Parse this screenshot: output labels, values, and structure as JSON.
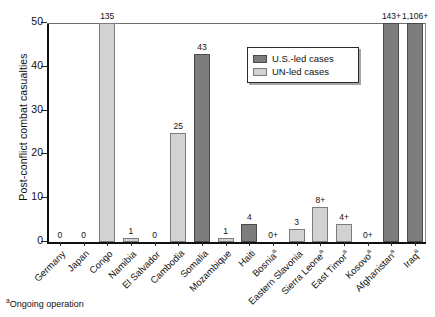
{
  "chart_data": {
    "type": "bar",
    "title": "",
    "xlabel": "",
    "ylabel": "Post-conflict combat casualties",
    "ylim": [
      0,
      50
    ],
    "yticks": [
      0,
      10,
      20,
      30,
      40,
      50
    ],
    "grid": false,
    "legend_position": "top-right",
    "legend": [
      {
        "key": "us",
        "label": "U.S.-led cases",
        "color": "#7d7d7d"
      },
      {
        "key": "un",
        "label": "UN-led cases",
        "color": "#d2d2d2"
      }
    ],
    "categories": [
      "Germany",
      "Japan",
      "Congo",
      "Namibia",
      "El Salvador",
      "Cambodia",
      "Somalia",
      "Mozambique",
      "Haiti",
      "Bosnia",
      "Eastern Slavonia",
      "Sierra Leone",
      "East Timor",
      "Kosovo",
      "Afghanistan",
      "Iraq"
    ],
    "points": [
      {
        "category": "Germany",
        "label": "0",
        "value": 0,
        "plotted": 0,
        "series": "us",
        "ongoing": false
      },
      {
        "category": "Japan",
        "label": "0",
        "value": 0,
        "plotted": 0,
        "series": "us",
        "ongoing": false
      },
      {
        "category": "Congo",
        "label": "135",
        "value": 135,
        "plotted": 50,
        "series": "un",
        "ongoing": false
      },
      {
        "category": "Namibia",
        "label": "1",
        "value": 1,
        "plotted": 1,
        "series": "un",
        "ongoing": false
      },
      {
        "category": "El Salvador",
        "label": "0",
        "value": 0,
        "plotted": 0,
        "series": "un",
        "ongoing": false
      },
      {
        "category": "Cambodia",
        "label": "25",
        "value": 25,
        "plotted": 25,
        "series": "un",
        "ongoing": false
      },
      {
        "category": "Somalia",
        "label": "43",
        "value": 43,
        "plotted": 43,
        "series": "us",
        "ongoing": false
      },
      {
        "category": "Mozambique",
        "label": "1",
        "value": 1,
        "plotted": 1,
        "series": "un",
        "ongoing": false
      },
      {
        "category": "Haiti",
        "label": "4",
        "value": 4,
        "plotted": 4,
        "series": "us",
        "ongoing": false
      },
      {
        "category": "Bosnia",
        "label": "0+",
        "value": 0,
        "plotted": 0,
        "series": "us",
        "ongoing": true
      },
      {
        "category": "Eastern Slavonia",
        "label": "3",
        "value": 3,
        "plotted": 3,
        "series": "un",
        "ongoing": false
      },
      {
        "category": "Sierra Leone",
        "label": "8+",
        "value": 8,
        "plotted": 8,
        "series": "un",
        "ongoing": true
      },
      {
        "category": "East Timor",
        "label": "4+",
        "value": 4,
        "plotted": 4,
        "series": "un",
        "ongoing": true
      },
      {
        "category": "Kosovo",
        "label": "0+",
        "value": 0,
        "plotted": 0,
        "series": "un",
        "ongoing": true
      },
      {
        "category": "Afghanistan",
        "label": "143+",
        "value": 143,
        "plotted": 50,
        "series": "us",
        "ongoing": true
      },
      {
        "category": "Iraq",
        "label": "1,106+",
        "value": 1106,
        "plotted": 50,
        "series": "us",
        "ongoing": true
      }
    ],
    "footnote": "Ongoing operation",
    "footnote_marker": "a"
  }
}
